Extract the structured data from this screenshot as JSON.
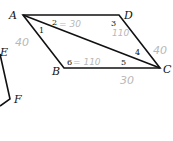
{
  "diagram": {
    "type": "parallelogram-with-diagonal",
    "vertices": [
      {
        "label": "A",
        "x": 23,
        "y": 15
      },
      {
        "label": "D",
        "x": 119,
        "y": 15
      },
      {
        "label": "C",
        "x": 160,
        "y": 68
      },
      {
        "label": "B",
        "x": 64,
        "y": 68
      }
    ],
    "partial_figure": {
      "labels": [
        "E",
        "F"
      ]
    },
    "angle_labels": [
      "1",
      "2",
      "3",
      "4",
      "5",
      "6"
    ],
    "annotations": {
      "angle2": "= 30",
      "angle3": "110",
      "angle6": "= 110",
      "side_AB": "40",
      "side_DC": "40",
      "side_BC": "30"
    },
    "colors": {
      "lines": "#111111",
      "handwriting": "#b8b8b8"
    }
  }
}
